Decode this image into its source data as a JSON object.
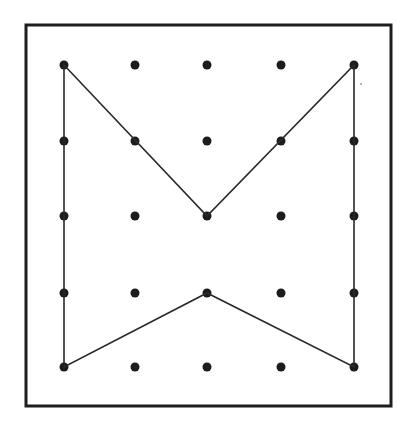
{
  "diagram": {
    "type": "geoboard",
    "grid": {
      "columns": 5,
      "rows": 5,
      "x_positions": [
        64,
        135,
        207,
        281,
        354
      ],
      "y_positions": [
        65,
        141,
        216,
        293,
        367
      ],
      "peg_radius": 4.5
    },
    "frame": {
      "x": 26,
      "y": 25,
      "width": 365,
      "height": 381
    },
    "polygon": {
      "description": "Closed rubber-band shape on geoboard (bow-tie / notched rectangle)",
      "vertices_grid": [
        [
          0,
          0
        ],
        [
          2,
          2
        ],
        [
          4,
          0
        ],
        [
          4,
          4
        ],
        [
          2,
          3
        ],
        [
          0,
          4
        ]
      ]
    },
    "colors": {
      "background": "#ffffff",
      "frame": "#1e1e1e",
      "band": "#2a2a2a",
      "peg": "#1c1c1c"
    }
  }
}
